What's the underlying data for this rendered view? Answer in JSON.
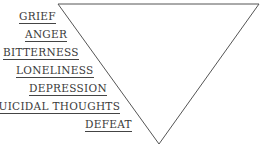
{
  "diagram": {
    "shape": "inverted-triangle",
    "stroke_color": "#555555",
    "text_color": "#3a3a3a",
    "labels": [
      {
        "text": "GRIEF",
        "right": 56,
        "top": 10
      },
      {
        "text": "ANGER",
        "right": 67,
        "top": 28
      },
      {
        "text": "BITTERNESS",
        "right": 79,
        "top": 46
      },
      {
        "text": "LONELINESS",
        "right": 94,
        "top": 64
      },
      {
        "text": "DEPRESSION",
        "right": 107,
        "top": 82
      },
      {
        "text": "SUICIDAL THOUGHTS",
        "right": 120,
        "top": 100
      },
      {
        "text": "DEFEAT",
        "right": 132,
        "top": 118
      }
    ]
  }
}
